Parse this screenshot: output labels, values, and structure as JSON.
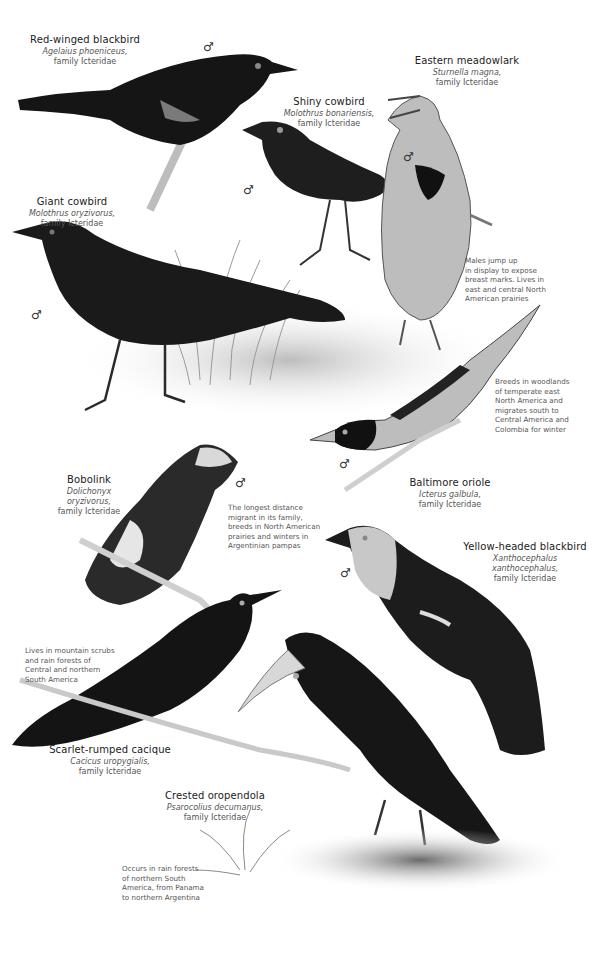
{
  "plate": {
    "family": "Icteridae",
    "sex_symbol": "♂",
    "background": "#ffffff",
    "ink_color": "#1a1a1a"
  },
  "species": [
    {
      "id": "red-winged-blackbird",
      "common": "Red-winged blackbird",
      "scientific": "Agelaius phoeniceus,",
      "family": "family Icteridae",
      "note": ""
    },
    {
      "id": "eastern-meadowlark",
      "common": "Eastern meadowlark",
      "scientific": "Sturnella magna,",
      "family": "family Icteridae",
      "note": "Males jump up\nin display to expose\nbreast marks. Lives in\neast and central North\nAmerican prairies"
    },
    {
      "id": "shiny-cowbird",
      "common": "Shiny cowbird",
      "scientific": "Molothrus bonariensis,",
      "family": "family Icteridae",
      "note": ""
    },
    {
      "id": "giant-cowbird",
      "common": "Giant cowbird",
      "scientific": "Molothrus oryzivorus,",
      "family": "family Icteridae",
      "note": ""
    },
    {
      "id": "baltimore-oriole",
      "common": "Baltimore oriole",
      "scientific": "Icterus galbula,",
      "family": "family Icteridae",
      "note": "Breeds in woodlands\nof temperate east\nNorth America and\nmigrates south to\nCentral America and\nColombia for winter"
    },
    {
      "id": "bobolink",
      "common": "Bobolink",
      "scientific": "Dolichonyx oryzivorus,",
      "family": "family Icteridae",
      "note": "The longest distance\nmigrant in its family,\nbreeds in North American\nprairies and winters in\nArgentinian pampas"
    },
    {
      "id": "yellow-headed-blackbird",
      "common": "Yellow-headed blackbird",
      "scientific": "Xanthocephalus xanthocephalus,",
      "family": "family Icteridae",
      "note": ""
    },
    {
      "id": "scarlet-rumped-cacique",
      "common": "Scarlet-rumped cacique",
      "scientific": "Cacicus uropygialis,",
      "family": "family Icteridae",
      "note": "Lives in mountain scrubs\nand rain forests of\nCentral and northern\nSouth America"
    },
    {
      "id": "crested-oropendola",
      "common": "Crested oropendola",
      "scientific": "Psarocolius decumanus,",
      "family": "family Icteridae",
      "note": "Occurs in rain forests\nof northern South\nAmerica, from Panama\nto northern Argentina"
    }
  ]
}
